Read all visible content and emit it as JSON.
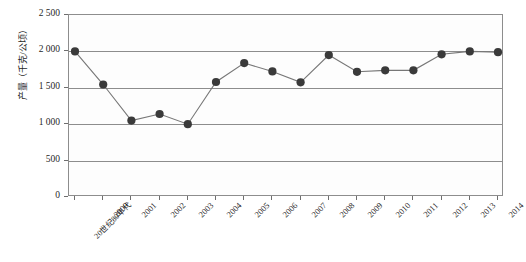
{
  "chart_data": {
    "type": "line",
    "title": "",
    "xlabel": "",
    "ylabel": "产量（千克/公顷）",
    "categories": [
      "20世纪80年代",
      "2000",
      "2001",
      "2002",
      "2003",
      "2004",
      "2005",
      "2006",
      "2007",
      "2008",
      "2009",
      "2010",
      "2011",
      "2012",
      "2013",
      "2014"
    ],
    "values": [
      2000,
      1545,
      1050,
      1140,
      1000,
      1580,
      1840,
      1725,
      1575,
      1950,
      1720,
      1740,
      1740,
      1960,
      2000,
      1990
    ],
    "ylim": [
      0,
      2500
    ],
    "ytick_values": [
      0,
      500,
      1000,
      1500,
      2000,
      2500
    ],
    "ytick_labels": [
      "0",
      "500",
      "1 000",
      "1 500",
      "2 000",
      "2 500"
    ],
    "grid": true,
    "legend": "none",
    "marker": "circle",
    "series_color": "#3a3a3a",
    "line_color": "#777777",
    "gridline_color": "#8d8d8d"
  }
}
